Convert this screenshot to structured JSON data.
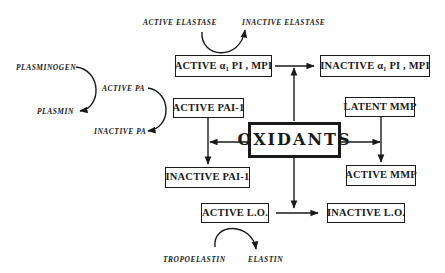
{
  "diagram": {
    "center": "OXIDANTS",
    "boxes": {
      "active_a1pi": "ACTIVE α₁ PI , MPI",
      "inactive_a1pi": "INACTIVE  α₁ PI , MPI",
      "active_pai1": "ACTIVE PAI-1",
      "inactive_pai1": "INACTIVE PAI-1",
      "latent_mmp": "LATENT MMP",
      "active_mmp": "ACTIVE MMP",
      "active_lo": "ACTIVE L.O.",
      "inactive_lo": "INACTIVE L.O."
    },
    "labels": {
      "active_elastase": "ACTIVE  ELASTASE",
      "inactive_elastase": "INACTIVE  ELASTASE",
      "plasminogen": "PLASMINOGEN",
      "plasmin": "PLASMIN",
      "active_pa": "ACTIVE  PA",
      "inactive_pa": "INACTIVE  PA",
      "tropoelastin": "TROPOELASTIN",
      "elastin": "ELASTIN"
    }
  }
}
